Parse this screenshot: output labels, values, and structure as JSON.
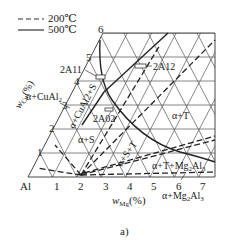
{
  "legend": {
    "items": [
      {
        "style": "dashed",
        "label": "200℃"
      },
      {
        "style": "solid",
        "label": "500℃"
      }
    ]
  },
  "axes": {
    "origin_label": "Al",
    "x_label_main": "w",
    "x_label_sub": "Mg",
    "x_label_unit": "(%)",
    "y_label_main": "w",
    "y_label_sub": "Cu",
    "y_label_unit": "(%)",
    "x_ticks": [
      "1",
      "2",
      "3",
      "4",
      "5",
      "6",
      "7"
    ],
    "y_ticks": [
      "1",
      "2",
      "3",
      "4",
      "5",
      "6"
    ]
  },
  "regions": {
    "alpha_cual2": "α+CuAl",
    "alpha_cual2_sub": "2",
    "alpha_cual2_s": "α+CuAl2+S",
    "alpha_s": "α+S",
    "alpha_s_t": "α+S+T",
    "alpha_t": "α+T",
    "alpha_t_mg2al3": "α+T+Mg",
    "alpha_t_mg2al3_sub": "2",
    "alpha_t_mg2al3_end": "Al",
    "alpha_t_mg2al3_sub2": "3",
    "alpha_mg2al3": "α+Mg",
    "alpha_mg2al3_sub": "2",
    "alpha_mg2al3_end": "Al",
    "alpha_mg2al3_sub2": "3"
  },
  "alloys": {
    "a": "2A11",
    "b": "2A12",
    "c": "2A02"
  },
  "caption": "a)"
}
